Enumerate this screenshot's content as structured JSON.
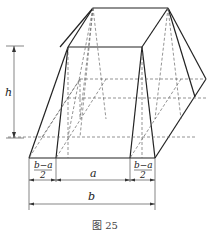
{
  "figure": {
    "caption": "图 25",
    "labels": {
      "height": "h",
      "top_width": "a",
      "bottom_width": "b",
      "left_offset_num": "b−a",
      "left_offset_den": "2",
      "right_offset_num": "b−a",
      "right_offset_den": "2"
    },
    "colors": {
      "line": "#222222",
      "hidden_line": "#666666",
      "background": "#ffffff"
    }
  }
}
